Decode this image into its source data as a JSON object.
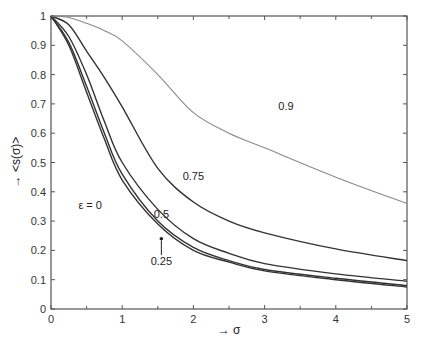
{
  "chart_data": {
    "type": "line",
    "title": "",
    "xlabel": "→ σ",
    "ylabel": "→ <s(σ)>",
    "xlim": [
      0,
      5
    ],
    "ylim": [
      0,
      1
    ],
    "grid": false,
    "legend_position": "none (inline curve labels)",
    "x_ticks": [
      "0",
      "1",
      "2",
      "3",
      "4",
      "5"
    ],
    "y_ticks": [
      "0",
      "0.1",
      "0.2",
      "0.3",
      "0.4",
      "0.5",
      "0.6",
      "0.7",
      "0.8",
      "0.9",
      "1"
    ],
    "x": [
      0,
      0.25,
      0.5,
      0.75,
      1,
      1.5,
      2,
      2.5,
      3,
      4,
      5
    ],
    "series": [
      {
        "name": "ε = 0",
        "color": "#333333",
        "values": [
          1.0,
          0.9,
          0.74,
          0.58,
          0.44,
          0.29,
          0.2,
          0.16,
          0.13,
          0.1,
          0.075
        ]
      },
      {
        "name": "0.25",
        "color": "#333333",
        "values": [
          1.0,
          0.91,
          0.76,
          0.6,
          0.46,
          0.3,
          0.21,
          0.165,
          0.135,
          0.105,
          0.08
        ]
      },
      {
        "name": "0.5",
        "color": "#333333",
        "values": [
          1.0,
          0.93,
          0.8,
          0.64,
          0.5,
          0.34,
          0.24,
          0.19,
          0.155,
          0.12,
          0.095
        ]
      },
      {
        "name": "0.75",
        "color": "#333333",
        "values": [
          1.0,
          0.97,
          0.88,
          0.79,
          0.69,
          0.48,
          0.365,
          0.3,
          0.26,
          0.205,
          0.165
        ]
      },
      {
        "name": "0.9",
        "color": "#8a8a8a",
        "values": [
          1.0,
          0.995,
          0.975,
          0.95,
          0.915,
          0.8,
          0.67,
          0.6,
          0.55,
          0.45,
          0.36
        ]
      }
    ],
    "annotations": [
      {
        "text": "ε = 0",
        "x": 0.55,
        "y": 0.34
      },
      {
        "text": "0.25",
        "x": 1.55,
        "y": 0.15,
        "arrow_to": [
          1.55,
          0.24
        ]
      },
      {
        "text": "0.5",
        "x": 1.55,
        "y": 0.31
      },
      {
        "text": "0.75",
        "x": 2.0,
        "y": 0.44
      },
      {
        "text": "0.9",
        "x": 3.3,
        "y": 0.68
      }
    ]
  },
  "labels": {
    "xlabel": "→ σ",
    "ylabel": "→ <s(σ)>"
  }
}
